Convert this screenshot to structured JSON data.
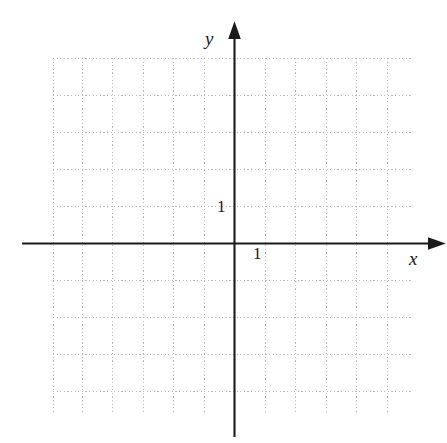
{
  "figure": {
    "kind": "cartesian-coordinate-grid",
    "background_color": "#ffffff",
    "width": 447,
    "height": 443
  },
  "axes": {
    "x_axis": {
      "label": "x",
      "tick_label": "1",
      "color": "#1a1a1a",
      "arrow": "right"
    },
    "y_axis": {
      "label": "y",
      "tick_label": "1",
      "color": "#1a1a1a",
      "arrow": "up"
    }
  },
  "grid": {
    "color": "#b9b9b9",
    "style": "dotted",
    "origin_px": {
      "x": 234,
      "y": 243
    },
    "unit_px": {
      "x": 30.5,
      "y": 37
    },
    "bounds_px": {
      "left": 53,
      "top": 58,
      "right": 411,
      "bottom": 412
    },
    "x_lines": [
      53,
      83.5,
      114,
      144.5,
      175,
      205.5,
      234,
      264.5,
      295,
      325.5,
      356,
      386.5,
      411
    ],
    "y_lines": [
      58,
      58.5,
      95.5,
      132.5,
      169.5,
      206,
      243,
      280,
      317,
      354,
      391,
      412
    ]
  },
  "chart_data": {
    "type": "scatter",
    "title": "",
    "xlabel": "x",
    "ylabel": "y",
    "series": [],
    "x": [],
    "y": [],
    "xlim": [
      -6,
      6
    ],
    "ylim": [
      -4.6,
      5
    ],
    "xticks": [
      1
    ],
    "yticks": [
      1
    ],
    "xticklabels": [
      "1"
    ],
    "yticklabels": [
      "1"
    ],
    "grid": true,
    "legend": false,
    "annotations": []
  }
}
